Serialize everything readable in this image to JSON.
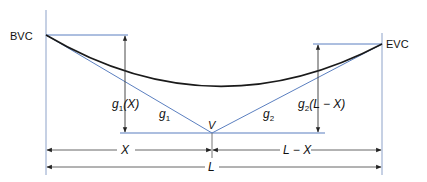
{
  "diagram": {
    "type": "vertical-sag-curve",
    "labels": {
      "bvc": "BVC",
      "evc": "EVC",
      "vertex": "V",
      "grade1": "g",
      "grade1_sub": "1",
      "grade2": "g",
      "grade2_sub": "2",
      "offset1_g": "g",
      "offset1_sub": "1",
      "offset1_arg": "(X)",
      "offset2_g": "g",
      "offset2_sub": "2",
      "offset2_arg": "(L − X)",
      "dim_x": "X",
      "dim_l_minus_x": "L − X",
      "dim_l": "L"
    },
    "colors": {
      "tangent_lines": "#5b7fc0",
      "curve": "#1a1a1a",
      "dimension_lines": "#555555",
      "text": "#111111"
    }
  }
}
